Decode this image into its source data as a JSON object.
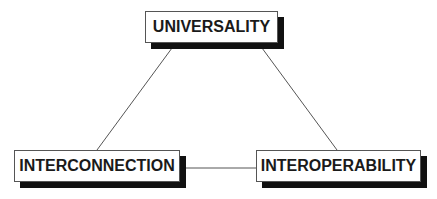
{
  "diagram": {
    "type": "triangle-concept-diagram",
    "nodes": [
      {
        "id": "universality",
        "label": "UNIVERSALITY"
      },
      {
        "id": "interconnection",
        "label": "INTERCONNECTION"
      },
      {
        "id": "interoperability",
        "label": "INTEROPERABILITY"
      }
    ],
    "edges": [
      {
        "from": "universality",
        "to": "interconnection"
      },
      {
        "from": "universality",
        "to": "interoperability"
      },
      {
        "from": "interconnection",
        "to": "interoperability"
      }
    ],
    "colors": {
      "background": "#ffffff",
      "box_fill": "#ffffff",
      "box_border": "#555555",
      "shadow": "#111111",
      "line": "#555555",
      "text": "#1a1a1a"
    }
  }
}
